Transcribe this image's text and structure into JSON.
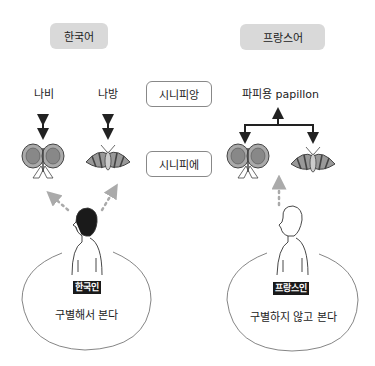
{
  "korean": {
    "language_label": "한국어",
    "words": [
      "나비",
      "나방"
    ],
    "person_label": "한국인",
    "caption": "구별해서 본다"
  },
  "french": {
    "language_label": "프랑스어",
    "word": "파피용 papillon",
    "person_label": "프랑스인",
    "caption": "구별하지 않고 본다"
  },
  "center": {
    "signifiant": "시니피앙",
    "signifie": "시니피에"
  },
  "icons": {
    "butterfly": "butterfly-illustration",
    "moth": "moth-illustration",
    "person": "person-illustration"
  },
  "colors": {
    "tag_bg": "#d9d9d9",
    "label_bg": "#1a1a1a",
    "dotted_arrow": "#aaaaaa"
  }
}
